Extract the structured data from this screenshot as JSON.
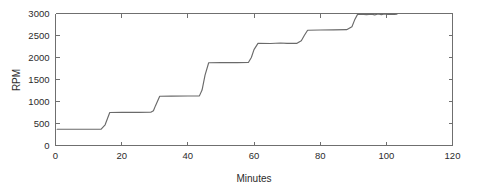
{
  "chart_data": {
    "type": "line",
    "title": "",
    "xlabel": "Minutes",
    "ylabel": "RPM",
    "xlim": [
      0,
      120
    ],
    "ylim": [
      0,
      3000
    ],
    "xticks": [
      0,
      20,
      40,
      60,
      80,
      100,
      120
    ],
    "yticks": [
      0,
      500,
      1000,
      1500,
      2000,
      2500,
      3000
    ],
    "xtick_labels": [
      "0",
      "20",
      "40",
      "60",
      "80",
      "100",
      "120"
    ],
    "ytick_labels": [
      "0",
      "500",
      "1000",
      "1500",
      "2000",
      "2500",
      "3000"
    ],
    "grid": false,
    "legend": null,
    "legend_position": "none",
    "line_color": "#6a6a6a",
    "axis_color": "#6f6f6f",
    "background_color": "#ffffff",
    "series": [
      {
        "name": "RPM",
        "x": [
          0.5,
          13.8,
          15.0,
          16.4,
          20.0,
          25.0,
          28.8,
          29.6,
          30.2,
          31.5,
          35.0,
          40.0,
          43.5,
          44.3,
          45.2,
          46.3,
          50.0,
          55.0,
          58.3,
          59.2,
          60.0,
          61.2,
          65.0,
          68.0,
          70.0,
          73.0,
          74.3,
          75.2,
          76.2,
          80.0,
          84.0,
          88.0,
          89.6,
          90.4,
          91.3,
          92.4,
          94.0,
          95.5,
          96.5,
          97.5,
          98.5,
          99.5,
          100.5,
          101.5,
          102.5,
          103.2
        ],
        "y": [
          370,
          370,
          470,
          750,
          752,
          753,
          755,
          790,
          900,
          1120,
          1122,
          1124,
          1128,
          1260,
          1600,
          1880,
          1882,
          1884,
          1886,
          2000,
          2180,
          2320,
          2318,
          2330,
          2320,
          2322,
          2380,
          2500,
          2620,
          2625,
          2628,
          2632,
          2700,
          2850,
          2980,
          2982,
          2975,
          2985,
          2970,
          2988,
          2975,
          2990,
          2978,
          2985,
          2980,
          2982
        ]
      }
    ],
    "plateaus": [
      {
        "level_rpm": 370,
        "start_min": 0.5,
        "end_min": 13.8
      },
      {
        "level_rpm": 750,
        "start_min": 16.4,
        "end_min": 28.8
      },
      {
        "level_rpm": 1120,
        "start_min": 31.5,
        "end_min": 43.5
      },
      {
        "level_rpm": 1880,
        "start_min": 46.3,
        "end_min": 58.3
      },
      {
        "level_rpm": 2320,
        "start_min": 61.2,
        "end_min": 74.3
      },
      {
        "level_rpm": 2620,
        "start_min": 76.2,
        "end_min": 89.6
      },
      {
        "level_rpm": 2980,
        "start_min": 91.3,
        "end_min": 103.2
      }
    ]
  }
}
